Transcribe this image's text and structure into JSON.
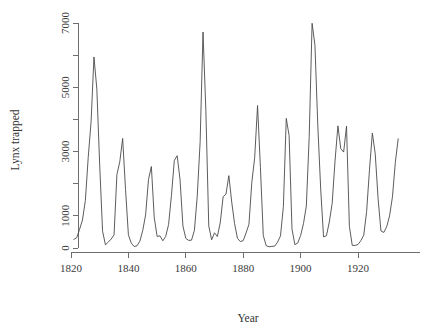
{
  "chart_data": {
    "type": "line",
    "title": "",
    "xlabel": "Year",
    "ylabel": "Lynx trapped",
    "xlim": [
      1818,
      1936
    ],
    "ylim": [
      0,
      7000
    ],
    "grid": false,
    "legend": null,
    "xticks": [
      1820,
      1840,
      1860,
      1880,
      1900,
      1920
    ],
    "xtick_labels": [
      "1820",
      "1840",
      "1860",
      "1880",
      "1900",
      "1920"
    ],
    "yticks": [
      0,
      1000,
      2000,
      3000,
      4000,
      5000,
      6000,
      7000
    ],
    "ytick_labels": [
      "0",
      "1000",
      "",
      "3000",
      "",
      "5000",
      "",
      "7000"
    ],
    "ytick_labels_shown": [
      "0",
      "1000",
      "3000",
      "5000",
      "7000"
    ],
    "series": [
      {
        "name": "Lynx trapped",
        "color": "#4a4a4a",
        "x": [
          1821,
          1822,
          1823,
          1824,
          1825,
          1826,
          1827,
          1828,
          1829,
          1830,
          1831,
          1832,
          1833,
          1834,
          1835,
          1836,
          1837,
          1838,
          1839,
          1840,
          1841,
          1842,
          1843,
          1844,
          1845,
          1846,
          1847,
          1848,
          1849,
          1850,
          1851,
          1852,
          1853,
          1854,
          1855,
          1856,
          1857,
          1858,
          1859,
          1860,
          1861,
          1862,
          1863,
          1864,
          1865,
          1866,
          1867,
          1868,
          1869,
          1870,
          1871,
          1872,
          1873,
          1874,
          1875,
          1876,
          1877,
          1878,
          1879,
          1880,
          1881,
          1882,
          1883,
          1884,
          1885,
          1886,
          1887,
          1888,
          1889,
          1890,
          1891,
          1892,
          1893,
          1894,
          1895,
          1896,
          1897,
          1898,
          1899,
          1900,
          1901,
          1902,
          1903,
          1904,
          1905,
          1906,
          1907,
          1908,
          1909,
          1910,
          1911,
          1912,
          1913,
          1914,
          1915,
          1916,
          1917,
          1918,
          1919,
          1920,
          1921,
          1922,
          1923,
          1924,
          1925,
          1926,
          1927,
          1928,
          1929,
          1930,
          1931,
          1932,
          1933,
          1934
        ],
        "values": [
          269,
          321,
          585,
          871,
          1475,
          2821,
          3928,
          5943,
          4950,
          2577,
          523,
          98,
          184,
          279,
          409,
          2285,
          2685,
          3409,
          1824,
          409,
          151,
          45,
          68,
          213,
          546,
          1033,
          2129,
          2536,
          957,
          361,
          377,
          225,
          360,
          731,
          1638,
          2725,
          2871,
          2119,
          684,
          299,
          236,
          245,
          552,
          1623,
          3311,
          6721,
          4254,
          687,
          255,
          473,
          358,
          784,
          1594,
          1676,
          2251,
          1426,
          756,
          299,
          201,
          229,
          469,
          736,
          2042,
          2811,
          4431,
          2511,
          389,
          73,
          39,
          49,
          59,
          188,
          377,
          1292,
          4031,
          3495,
          587,
          105,
          153,
          387,
          758,
          1307,
          3465,
          6991,
          6313,
          3794,
          1836,
          345,
          382,
          808,
          1388,
          2713,
          3800,
          3091,
          2985,
          3790,
          674,
          81,
          80,
          108,
          229,
          399,
          1132,
          2432,
          3574,
          2935,
          1537,
          529,
          485,
          662,
          1000,
          1590,
          2657,
          3396
        ]
      }
    ]
  },
  "figure": {
    "background_color": "#ffffff",
    "axis_color": "#6e6e6e",
    "line_color": "#4a4a4a"
  }
}
